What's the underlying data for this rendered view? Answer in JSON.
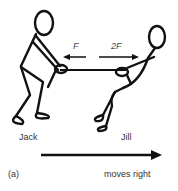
{
  "figure": {
    "panel_label": "(a)",
    "people": [
      {
        "name": "Jack",
        "position": "left"
      },
      {
        "name": "Jill",
        "position": "right"
      }
    ],
    "forces": [
      {
        "label": "F",
        "direction": "left"
      },
      {
        "label": "2F",
        "direction": "right"
      }
    ],
    "motion": {
      "label": "moves right",
      "direction": "right"
    },
    "colors": {
      "ink": "#111111",
      "text": "#333333",
      "background": "#ffffff"
    }
  }
}
